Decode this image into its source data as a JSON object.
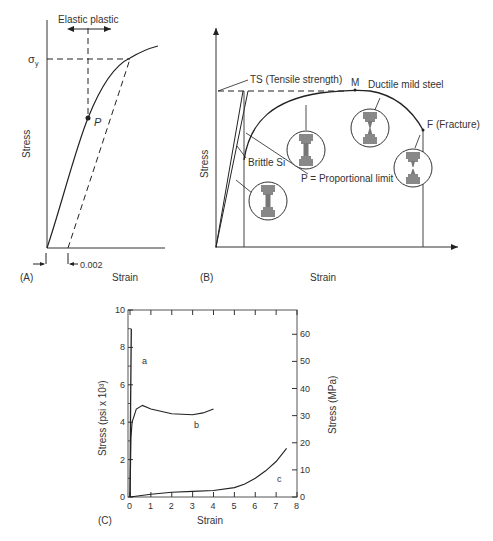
{
  "panel_a": {
    "label": "(A)",
    "xlabel": "Strain",
    "ylabel": "Stress",
    "yield_label": "σ",
    "yield_sub": "y",
    "region_label": "Elastic plastic",
    "point_label": "P",
    "offset_label": "0.002"
  },
  "panel_b": {
    "label": "(B)",
    "xlabel": "Strain",
    "ylabel": "Stress",
    "ts_label": "TS (Tensile strength)",
    "m_label": "M",
    "ductile_label": "Ductile mild steel",
    "fracture_label": "F (Fracture)",
    "brittle_label": "Brittle Si",
    "p_label": "P = Proportional limit"
  },
  "panel_c": {
    "label": "(C)",
    "xlabel": "Strain",
    "ylabel_left": "Stress (psi x 10³)",
    "ylabel_right": "Stress (MPa)",
    "x_ticks": [
      "0",
      "1",
      "2",
      "3",
      "4",
      "5",
      "6",
      "7",
      "8"
    ],
    "y_ticks_left": [
      "0",
      "2",
      "4",
      "6",
      "8",
      "10"
    ],
    "y_ticks_right": [
      "0",
      "10",
      "20",
      "30",
      "40",
      "50",
      "60"
    ],
    "curve_labels": {
      "a": "a",
      "b": "b",
      "c": "c"
    }
  },
  "chart_data": [
    {
      "type": "line",
      "title": "(A) Stress-strain curve with 0.002 offset yield",
      "xlabel": "Strain",
      "ylabel": "Stress",
      "annotations": [
        "Elastic plastic",
        "σy",
        "P",
        "0.002"
      ],
      "series": [
        {
          "name": "stress-strain curve",
          "shape": "linear then yielding"
        },
        {
          "name": "0.002 offset line",
          "style": "dashed",
          "parallel_to_elastic": true
        }
      ],
      "grid": false
    },
    {
      "type": "line",
      "title": "(B) Brittle vs ductile stress-strain",
      "xlabel": "Strain",
      "ylabel": "Stress",
      "annotations": [
        "TS (Tensile strength)",
        "M",
        "Ductile mild steel",
        "F (Fracture)",
        "Brittle Si",
        "P = Proportional limit"
      ],
      "series": [
        {
          "name": "Brittle Si",
          "shape": "linear to fracture"
        },
        {
          "name": "Ductile mild steel",
          "shape": "elastic, yield, max at M, necking, fracture at F"
        }
      ],
      "grid": false
    },
    {
      "type": "line",
      "title": "(C)",
      "xlabel": "Strain",
      "ylabel": "Stress (psi x 10³)",
      "ylabel_right": "Stress (MPa)",
      "xlim": [
        0,
        8
      ],
      "ylim": [
        0,
        10
      ],
      "ylim_right": [
        0,
        69
      ],
      "series": [
        {
          "name": "a",
          "x": [
            0,
            0.03,
            0.06
          ],
          "y": [
            0,
            5,
            9.0
          ]
        },
        {
          "name": "b",
          "x": [
            0,
            0.05,
            0.1,
            0.3,
            0.6,
            1.0,
            2.0,
            3.0,
            3.5,
            4.0
          ],
          "y": [
            0,
            3.2,
            4.0,
            4.7,
            4.9,
            4.7,
            4.45,
            4.4,
            4.5,
            4.7
          ]
        },
        {
          "name": "c",
          "x": [
            0,
            1,
            2,
            3,
            4,
            5,
            5.5,
            6,
            6.5,
            7,
            7.5
          ],
          "y": [
            0,
            0.15,
            0.25,
            0.3,
            0.35,
            0.5,
            0.7,
            1.0,
            1.4,
            1.9,
            2.6
          ]
        }
      ],
      "grid": false
    }
  ]
}
